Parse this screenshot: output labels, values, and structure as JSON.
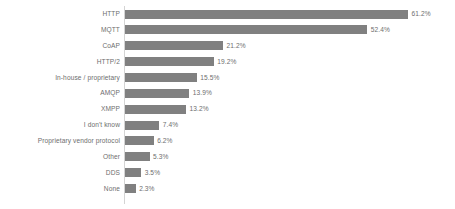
{
  "chart_data": {
    "type": "bar",
    "orientation": "horizontal",
    "title": "",
    "subtitle": "",
    "xlabel": "",
    "ylabel": "",
    "grid": false,
    "legend": false,
    "legend_position": "none",
    "axis_visible": true,
    "xlim": [
      0,
      61.2
    ],
    "bar_color": "#808080",
    "label_color": "#6e6e6e",
    "axis_color": "#d4d4d4",
    "background_color": "#ffffff",
    "value_suffix": "%",
    "categories": [
      "HTTP",
      "MQTT",
      "CoAP",
      "HTTP/2",
      "In-house / proprietary",
      "AMQP",
      "XMPP",
      "I don't know",
      "Proprietary vendor protocol",
      "Other",
      "DDS",
      "None"
    ],
    "values": [
      61.2,
      52.4,
      21.2,
      19.2,
      15.5,
      13.9,
      13.2,
      7.4,
      6.2,
      5.3,
      3.5,
      2.3
    ],
    "value_labels": [
      "61.2%",
      "52.4%",
      "21.2%",
      "19.2%",
      "15.5%",
      "13.9%",
      "13.2%",
      "7.4%",
      "6.2%",
      "5.3%",
      "3.5%",
      "2.3%"
    ]
  }
}
